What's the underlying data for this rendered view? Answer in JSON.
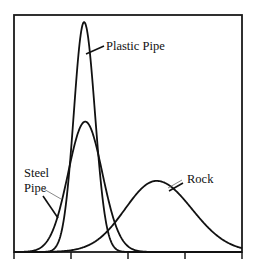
{
  "chart_data": {
    "type": "line",
    "title": "",
    "xlabel": "",
    "ylabel": "",
    "xlim": [
      0,
      4
    ],
    "ylim": [
      0,
      1
    ],
    "x_ticks": [
      0,
      1,
      2,
      3,
      4
    ],
    "x_tick_labels": [
      "",
      "",
      "",
      "",
      ""
    ],
    "grid": false,
    "legend": "none",
    "series": [
      {
        "name": "Plastic Pipe",
        "label": "Plastic Pipe",
        "mean": 1.23,
        "sd_left": 0.18,
        "sd_right": 0.19,
        "peak": 0.97
      },
      {
        "name": "Steel Pipe",
        "label": "Steel\nPipe",
        "label_lines": [
          "Steel",
          "Pipe"
        ],
        "mean": 1.25,
        "sd_left": 0.3,
        "sd_right": 0.3,
        "peak": 0.55
      },
      {
        "name": "Rock",
        "label": "Rock",
        "mean": 2.5,
        "sd_left": 0.55,
        "sd_right": 0.62,
        "peak": 0.3
      }
    ]
  }
}
